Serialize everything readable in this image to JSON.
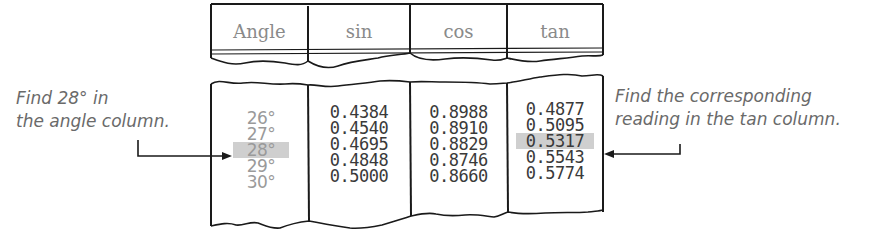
{
  "table": {
    "headers": [
      "Angle",
      "sin",
      "cos",
      "tan"
    ],
    "rows": [
      {
        "angle": "26°",
        "sin": "0.4384",
        "cos": "0.8988",
        "tan": "0.4877"
      },
      {
        "angle": "27°",
        "sin": "0.4540",
        "cos": "0.8910",
        "tan": "0.5095"
      },
      {
        "angle": "28°",
        "sin": "0.4695",
        "cos": "0.8829",
        "tan": "0.5317"
      },
      {
        "angle": "29°",
        "sin": "0.4848",
        "cos": "0.8746",
        "tan": "0.5543"
      },
      {
        "angle": "30°",
        "sin": "0.5000",
        "cos": "0.8660",
        "tan": "0.5774"
      }
    ],
    "highlight_row_index": 2,
    "highlight_color": "#cfcfcf"
  },
  "annotations": {
    "left": {
      "line1": "Find 28° in",
      "line2": "the angle column."
    },
    "right": {
      "line1": "Find the corresponding",
      "line2": "reading in the tan column."
    }
  }
}
